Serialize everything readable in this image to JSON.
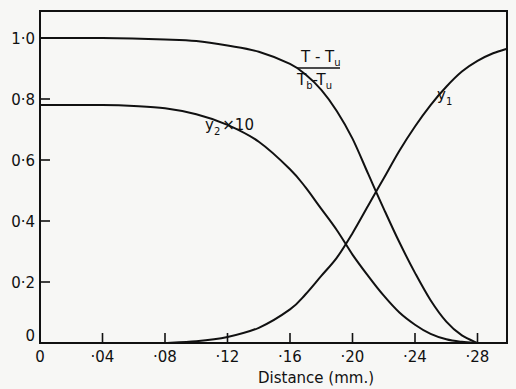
{
  "chart_data": {
    "type": "line",
    "title": "",
    "xlabel": "Distance (mm.)",
    "ylabel": "",
    "xlim": [
      0,
      0.3
    ],
    "ylim": [
      0,
      1.08
    ],
    "grid": false,
    "x_ticks": [
      {
        "value": 0,
        "label": "0"
      },
      {
        "value": 0.04,
        "label": "·04"
      },
      {
        "value": 0.08,
        "label": "·08"
      },
      {
        "value": 0.12,
        "label": "·12"
      },
      {
        "value": 0.16,
        "label": "·16"
      },
      {
        "value": 0.2,
        "label": "·20"
      },
      {
        "value": 0.24,
        "label": "·24"
      },
      {
        "value": 0.28,
        "label": "·28"
      }
    ],
    "y_ticks": [
      {
        "value": 0,
        "label": "0"
      },
      {
        "value": 0.2,
        "label": "0·2"
      },
      {
        "value": 0.4,
        "label": "0·4"
      },
      {
        "value": 0.6,
        "label": "0·6"
      },
      {
        "value": 0.8,
        "label": "0·8"
      },
      {
        "value": 1.0,
        "label": "1·0"
      }
    ],
    "series": [
      {
        "name": "(T - Tu)/(Tb - Tu)",
        "label_parts": {
          "num_a": "T - T",
          "num_sub": "u",
          "den_a": "T",
          "den_sub1": "b",
          "den_b": "-T",
          "den_sub2": "u"
        },
        "x": [
          0,
          0.04,
          0.08,
          0.1,
          0.12,
          0.14,
          0.16,
          0.17,
          0.18,
          0.19,
          0.2,
          0.21,
          0.22,
          0.23,
          0.24,
          0.25,
          0.26,
          0.27,
          0.28
        ],
        "y": [
          1.0,
          1.0,
          0.995,
          0.99,
          0.975,
          0.955,
          0.915,
          0.88,
          0.83,
          0.76,
          0.67,
          0.555,
          0.44,
          0.33,
          0.23,
          0.14,
          0.07,
          0.025,
          0.0
        ]
      },
      {
        "name": "y2 x 10",
        "label_parts": {
          "main": "y",
          "sub": "2",
          "suffix": "×10"
        },
        "x": [
          0,
          0.04,
          0.06,
          0.08,
          0.1,
          0.12,
          0.14,
          0.16,
          0.17,
          0.18,
          0.19,
          0.2,
          0.21,
          0.22,
          0.23,
          0.24,
          0.25,
          0.26,
          0.27,
          0.28
        ],
        "y": [
          0.78,
          0.78,
          0.777,
          0.77,
          0.75,
          0.715,
          0.66,
          0.57,
          0.51,
          0.44,
          0.37,
          0.29,
          0.22,
          0.155,
          0.1,
          0.06,
          0.03,
          0.012,
          0.004,
          0.0
        ]
      },
      {
        "name": "y1",
        "label_parts": {
          "main": "y",
          "sub": "1"
        },
        "x": [
          0.08,
          0.1,
          0.12,
          0.14,
          0.16,
          0.17,
          0.18,
          0.19,
          0.2,
          0.21,
          0.22,
          0.23,
          0.24,
          0.25,
          0.26,
          0.27,
          0.28,
          0.29,
          0.3
        ],
        "y": [
          0.0,
          0.006,
          0.02,
          0.05,
          0.11,
          0.16,
          0.22,
          0.28,
          0.36,
          0.45,
          0.54,
          0.63,
          0.71,
          0.78,
          0.84,
          0.89,
          0.925,
          0.95,
          0.965
        ]
      }
    ]
  }
}
